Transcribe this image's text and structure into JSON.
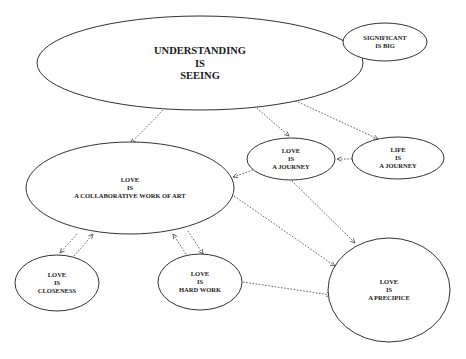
{
  "diagram": {
    "nodes": [
      {
        "id": "understanding",
        "lines": [
          "UNDERSTANDING",
          "IS",
          "SEEING"
        ],
        "cx": 200,
        "cy": 63,
        "rx": 163,
        "ry": 47,
        "font_size": 10.5
      },
      {
        "id": "significant",
        "lines": [
          "SIGNIFICANT",
          "IS BIG"
        ],
        "cx": 385,
        "cy": 42,
        "rx": 42,
        "ry": 19,
        "font_size": 6.5
      },
      {
        "id": "love-journey",
        "lines": [
          "LOVE",
          "IS",
          "A JOURNEY"
        ],
        "cx": 291,
        "cy": 159,
        "rx": 44,
        "ry": 21,
        "font_size": 6.5
      },
      {
        "id": "life-journey",
        "lines": [
          "LIFE",
          "IS",
          "A JOURNEY"
        ],
        "cx": 398,
        "cy": 158,
        "rx": 46,
        "ry": 21,
        "font_size": 6.5
      },
      {
        "id": "love-art",
        "lines": [
          "LOVE",
          "IS",
          "A COLLABORATIVE WORK OF ART"
        ],
        "cx": 130,
        "cy": 188,
        "rx": 104,
        "ry": 46,
        "font_size": 6.5
      },
      {
        "id": "love-closeness",
        "lines": [
          "LOVE",
          "IS",
          "CLOSENESS"
        ],
        "cx": 57,
        "cy": 283,
        "rx": 42,
        "ry": 28,
        "font_size": 6.5
      },
      {
        "id": "love-hardwork",
        "lines": [
          "LOVE",
          "IS",
          "HARD WORK"
        ],
        "cx": 200,
        "cy": 282,
        "rx": 42,
        "ry": 28,
        "font_size": 6.5
      },
      {
        "id": "love-precipice",
        "lines": [
          "LOVE",
          "IS",
          "A PRECIPICE"
        ],
        "cx": 389,
        "cy": 290,
        "rx": 61,
        "ry": 52,
        "font_size": 6.5
      }
    ],
    "edges": [
      {
        "from": "understanding",
        "to": "significant",
        "x1": 282,
        "y1": 73,
        "x2": 345,
        "y2": 52
      },
      {
        "from": "understanding",
        "to": "love-art",
        "x1": 163,
        "y1": 110,
        "x2": 131,
        "y2": 143
      },
      {
        "from": "understanding",
        "to": "love-journey",
        "x1": 252,
        "y1": 104,
        "x2": 289,
        "y2": 136
      },
      {
        "from": "understanding",
        "to": "life-journey",
        "x1": 272,
        "y1": 90,
        "x2": 378,
        "y2": 139
      },
      {
        "from": "life-journey",
        "to": "love-journey",
        "x1": 352,
        "y1": 159,
        "x2": 337,
        "y2": 159
      },
      {
        "from": "love-journey",
        "to": "love-art",
        "x1": 253,
        "y1": 170,
        "x2": 233,
        "y2": 177
      },
      {
        "from": "love-journey",
        "to": "love-precipice",
        "x1": 292,
        "y1": 181,
        "x2": 355,
        "y2": 243
      },
      {
        "from": "love-art",
        "to": "love-precipice",
        "x1": 234,
        "y1": 196,
        "x2": 335,
        "y2": 266
      },
      {
        "from": "love-hardwork",
        "to": "love-precipice",
        "x1": 243,
        "y1": 282,
        "x2": 331,
        "y2": 295
      },
      {
        "from": "love-art",
        "to": "love-closeness",
        "x1": 77,
        "y1": 234,
        "x2": 60,
        "y2": 253
      },
      {
        "from": "love-closeness",
        "to": "love-art",
        "x1": 74,
        "y1": 256,
        "x2": 93,
        "y2": 234
      },
      {
        "from": "love-hardwork",
        "to": "love-art",
        "x1": 186,
        "y1": 254,
        "x2": 173,
        "y2": 234
      },
      {
        "from": "love-art",
        "to": "love-hardwork",
        "x1": 188,
        "y1": 231,
        "x2": 203,
        "y2": 254
      }
    ]
  }
}
